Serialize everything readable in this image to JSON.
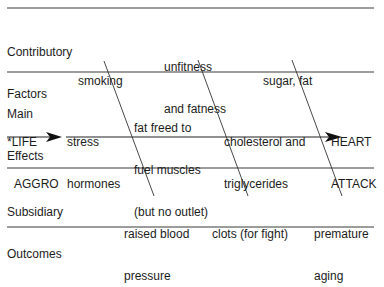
{
  "diagram": {
    "type": "fishbone-cause-effect",
    "rows": {
      "contributory": {
        "label_line1": "Contributory",
        "label_line2": "Factors"
      },
      "main": {
        "label_line1": "Main",
        "label_line2": "Effects"
      },
      "subsidiary": {
        "label_line1": "Subsidiary",
        "label_line2": "Outcomes"
      }
    },
    "start": {
      "line1": "*LIFE",
      "line2": "AGGRO"
    },
    "end": {
      "line1": "HEART",
      "line2": "ATTACK"
    },
    "contributory_factors": [
      {
        "line1": "smoking",
        "line2": ""
      },
      {
        "line1": "unfitness",
        "line2": "and fatness"
      },
      {
        "line1": "sugar, fat",
        "line2": ""
      }
    ],
    "main_effects": [
      {
        "line1": "stress",
        "line2": "hormones",
        "line3": ""
      },
      {
        "line1": "fat freed to",
        "line2": "fuel muscles",
        "line3": "(but no outlet)"
      },
      {
        "line1": "cholesterol and",
        "line2": "triglycerides",
        "line3": ""
      }
    ],
    "subsidiary_outcomes": [
      {
        "line1": "raised blood",
        "line2": "pressure"
      },
      {
        "line1": "clots (for fight)",
        "line2": ""
      },
      {
        "line1": "premature",
        "line2": "aging"
      }
    ],
    "colors": {
      "line": "#3a3a3a",
      "text": "#1c1c1c",
      "background": "#ffffff"
    }
  }
}
